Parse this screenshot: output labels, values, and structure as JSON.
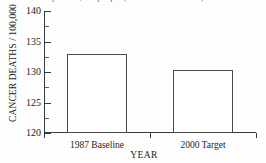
{
  "chart_data": {
    "type": "bar",
    "title": "per 100,000 people (1987 Baseline = 133)",
    "title_cropped": true,
    "categories": [
      "1987 Baseline",
      "2000 Target"
    ],
    "values": [
      133.0,
      130.3
    ],
    "series": [
      {
        "name": "Cancer deaths per 100,000",
        "values": [
          133.0,
          130.3
        ]
      }
    ],
    "xlabel": "YEAR",
    "ylabel": "CANCER DEATHS / 100,000",
    "ylim": [
      120,
      140
    ],
    "ytick_values": [
      120,
      125,
      130,
      135,
      140
    ],
    "ytick_labels": [
      "120",
      "125",
      "130",
      "135",
      "140"
    ],
    "yminor_values": [
      122.5,
      127.5,
      132.5,
      137.5
    ],
    "grid": false,
    "legend": false,
    "bar_fill": "#ffffff",
    "bar_edge": "#4a4a4a",
    "axis_color": "#3a3a3a"
  }
}
